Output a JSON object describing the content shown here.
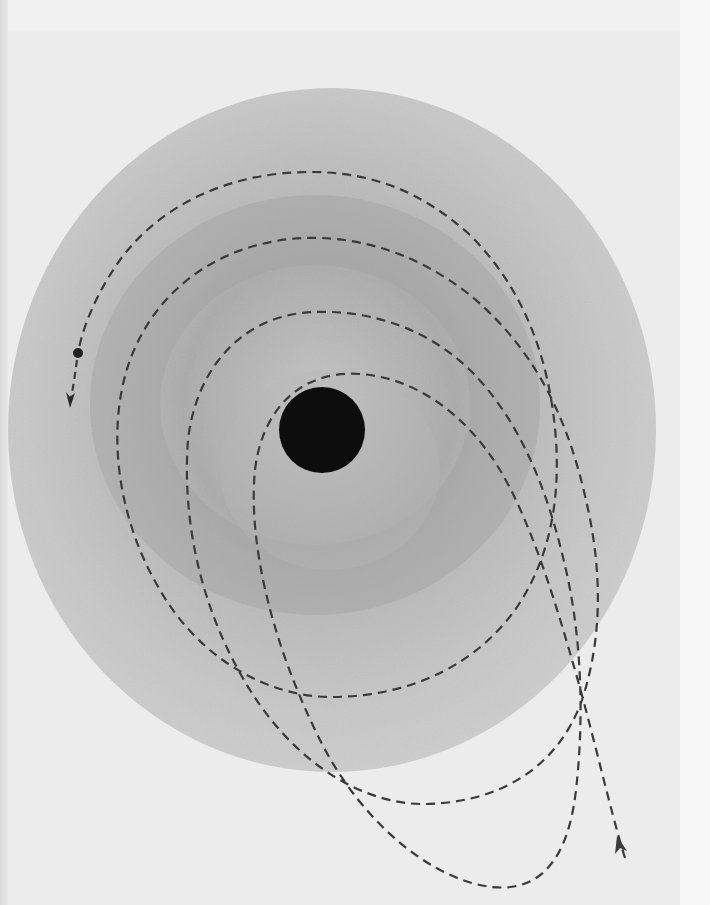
{
  "figure": {
    "colors": {
      "page_background": "#ececec",
      "disk_outer": "#cfcfcf",
      "disk_mid": "#b9b9b9",
      "disk_inner_ring": "#a9a9a9",
      "central_mass": "#0d0d0d",
      "trajectory": "#3a3a3a"
    },
    "disk": {
      "center_x": 332,
      "center_y": 430,
      "radius_x": 324,
      "radius_y": 342
    },
    "central_mass": {
      "center_x": 322,
      "center_y": 430,
      "radius": 43
    },
    "trajectory": {
      "style": "dashed",
      "loops": 4,
      "entry_arrow": {
        "x": 619,
        "y": 840,
        "direction": "up-left"
      },
      "end_marker": {
        "type": "dot",
        "x": 78,
        "y": 353
      },
      "exit_arrow": {
        "x": 70,
        "y": 405,
        "direction": "down"
      }
    }
  }
}
